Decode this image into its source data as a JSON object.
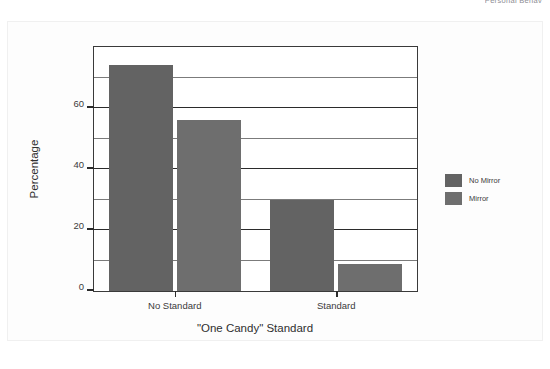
{
  "page": {
    "running_head": "Personal Behav"
  },
  "chart_data": {
    "type": "bar",
    "title": "",
    "xlabel": "\"One Candy\" Standard",
    "ylabel": "Percentage",
    "categories": [
      "No Standard",
      "Standard"
    ],
    "series": [
      {
        "name": "No Mirror",
        "values": [
          74,
          30
        ],
        "color": "#636363"
      },
      {
        "name": "Mirror",
        "values": [
          56,
          9
        ],
        "color": "#6e6e6e"
      }
    ],
    "ylim": [
      0,
      80
    ],
    "yticks": [
      0,
      20,
      40,
      60
    ],
    "ytick_labels": [
      "0",
      "20",
      "40",
      "60"
    ],
    "gridlines": [
      10,
      20,
      30,
      40,
      50,
      60,
      70
    ],
    "grid": true,
    "legend_position": "right"
  }
}
